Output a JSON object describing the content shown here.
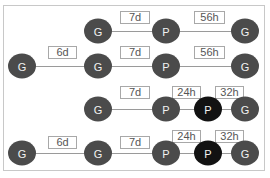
{
  "diagram": {
    "rows": [
      {
        "y": 31,
        "nodes": [
          {
            "label": "G",
            "x": 98,
            "type": "G"
          },
          {
            "label": "P",
            "x": 166,
            "type": "P"
          },
          {
            "label": "G",
            "x": 245,
            "type": "G"
          }
        ],
        "edges": [
          {
            "label": "7d",
            "x": 120,
            "w": 22,
            "y": 11
          },
          {
            "label": "56h",
            "x": 194,
            "w": 23,
            "y": 11
          }
        ]
      },
      {
        "y": 66,
        "nodes": [
          {
            "label": "G",
            "x": 22,
            "type": "G"
          },
          {
            "label": "G",
            "x": 98,
            "type": "G"
          },
          {
            "label": "P",
            "x": 166,
            "type": "P"
          },
          {
            "label": "G",
            "x": 245,
            "type": "G"
          }
        ],
        "edges": [
          {
            "label": "6d",
            "x": 48,
            "w": 21,
            "y": 46
          },
          {
            "label": "7d",
            "x": 120,
            "w": 22,
            "y": 46
          },
          {
            "label": "56h",
            "x": 194,
            "w": 23,
            "y": 46
          }
        ]
      },
      {
        "y": 109,
        "nodes": [
          {
            "label": "G",
            "x": 98,
            "type": "G"
          },
          {
            "label": "P",
            "x": 166,
            "type": "P"
          },
          {
            "label": "P",
            "x": 208,
            "type": "P-highlight"
          },
          {
            "label": "G",
            "x": 245,
            "type": "G"
          }
        ],
        "edges": [
          {
            "label": "7d",
            "x": 120,
            "w": 22,
            "y": 86
          },
          {
            "label": "24h",
            "x": 172,
            "w": 21,
            "y": 86
          },
          {
            "label": "32h",
            "x": 215,
            "w": 21,
            "y": 86
          }
        ]
      },
      {
        "y": 153,
        "nodes": [
          {
            "label": "G",
            "x": 22,
            "type": "G"
          },
          {
            "label": "G",
            "x": 98,
            "type": "G"
          },
          {
            "label": "P",
            "x": 166,
            "type": "P"
          },
          {
            "label": "P",
            "x": 208,
            "type": "P-highlight"
          },
          {
            "label": "G",
            "x": 245,
            "type": "G"
          }
        ],
        "edges": [
          {
            "label": "6d",
            "x": 48,
            "w": 21,
            "y": 136
          },
          {
            "label": "7d",
            "x": 120,
            "w": 22,
            "y": 136
          },
          {
            "label": "24h",
            "x": 172,
            "w": 21,
            "y": 130
          },
          {
            "label": "32h",
            "x": 215,
            "w": 21,
            "y": 130
          }
        ]
      }
    ],
    "colors": {
      "node": "#4b4b4b",
      "node_highlight": "#121212",
      "line": "#9a9a9a",
      "label_border": "#a8a8a8",
      "label_text": "#555555"
    }
  }
}
